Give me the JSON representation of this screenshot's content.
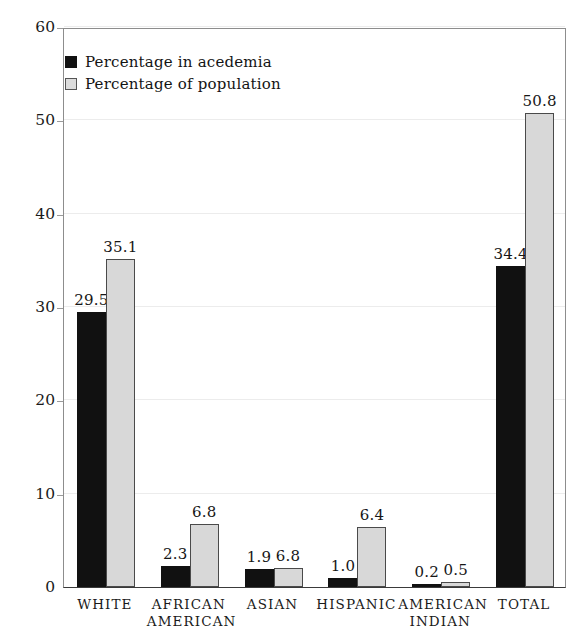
{
  "chart_data": {
    "type": "bar",
    "title": "",
    "xlabel": "",
    "ylabel": "",
    "ylim": [
      0,
      60
    ],
    "yticks": [
      0,
      10,
      20,
      30,
      40,
      50,
      60
    ],
    "grid": true,
    "legend_position": "top-left",
    "categories": [
      "WHITE",
      "AFRICAN AMERICAN",
      "ASIAN",
      "HISPANIC",
      "AMERICAN INDIAN",
      "TOTAL"
    ],
    "category_lines": [
      [
        "WHITE"
      ],
      [
        "AFRICAN",
        "AMERICAN"
      ],
      [
        "ASIAN"
      ],
      [
        "HISPANIC"
      ],
      [
        "AMERICAN",
        "INDIAN"
      ],
      [
        "TOTAL"
      ]
    ],
    "series": [
      {
        "name": "Percentage in acedemia",
        "color": "#111111",
        "values": [
          29.5,
          2.3,
          1.9,
          1.0,
          0.2,
          34.4
        ],
        "labels": [
          "29.5",
          "2.3",
          "1.9",
          "1.0",
          "0.2",
          "34.4"
        ],
        "drawn_heights": [
          29.5,
          2.3,
          1.9,
          1.0,
          0.2,
          34.4
        ]
      },
      {
        "name": "Percentage of population",
        "color": "#d8d8d8",
        "values": [
          35.1,
          6.8,
          6.8,
          6.4,
          0.5,
          50.8
        ],
        "labels": [
          "35.1",
          "6.8",
          "6.8",
          "6.4",
          "0.5",
          "50.8"
        ],
        "drawn_heights": [
          35.1,
          6.8,
          2.0,
          6.4,
          0.5,
          50.8
        ]
      }
    ]
  },
  "legend": {
    "items": [
      {
        "label": "Percentage in acedemia",
        "key": "academia"
      },
      {
        "label": "Percentage of population",
        "key": "population"
      }
    ]
  },
  "colors": {
    "academia": "#111111",
    "population": "#d8d8d8",
    "axis": "#3a3a3a",
    "grid": "#ececec",
    "text": "#1a1a1a"
  }
}
